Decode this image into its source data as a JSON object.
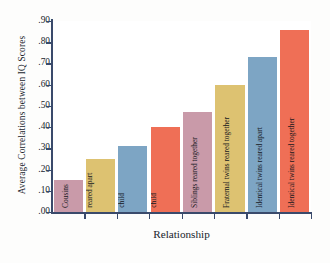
{
  "chart_data": {
    "type": "bar",
    "title": "",
    "xlabel": "Relationship",
    "ylabel": "Average Correlations between IQ Scores",
    "ylim": [
      0.0,
      0.9
    ],
    "grid": false,
    "legend": "none",
    "ytick_labels": [
      ".90",
      ".80",
      ".70",
      ".60",
      ".50",
      ".40",
      ".30",
      ".20",
      ".10",
      ".00"
    ],
    "ytick_values": [
      0.9,
      0.8,
      0.7,
      0.6,
      0.5,
      0.4,
      0.3,
      0.2,
      0.1,
      0.0
    ],
    "categories": [
      "Cousins",
      "Siblings reared apart",
      "Foster parent/ child",
      "Biological parent/ child",
      "Siblings reared together",
      "Fraternal twins reared together",
      "Identical twins reared apart",
      "Identical twins reared together"
    ],
    "values": [
      0.15,
      0.25,
      0.31,
      0.4,
      0.47,
      0.6,
      0.73,
      0.86
    ],
    "bar_colors": [
      "#c99aa9",
      "#ddc271",
      "#7da5c4",
      "#ef6f56",
      "#c99aa9",
      "#ddc271",
      "#7da5c4",
      "#ef6f56"
    ],
    "bars": [
      {
        "label_line1": "Cousins",
        "label_line2": "",
        "value": 0.15,
        "color": "#c99aa9"
      },
      {
        "label_line1": "Siblings",
        "label_line2": "reared apart",
        "value": 0.25,
        "color": "#ddc271"
      },
      {
        "label_line1": "Foster parent/",
        "label_line2": "child",
        "value": 0.31,
        "color": "#7da5c4"
      },
      {
        "label_line1": "Biological parent/",
        "label_line2": "child",
        "value": 0.4,
        "color": "#ef6f56"
      },
      {
        "label_line1": "Siblings reared together",
        "label_line2": "",
        "value": 0.47,
        "color": "#c99aa9"
      },
      {
        "label_line1": "Fraternal twins reared together",
        "label_line2": "",
        "value": 0.6,
        "color": "#ddc271"
      },
      {
        "label_line1": "Identical twins reared apart",
        "label_line2": "",
        "value": 0.73,
        "color": "#7da5c4"
      },
      {
        "label_line1": "Identical twins reared together",
        "label_line2": "",
        "value": 0.86,
        "color": "#ef6f56"
      }
    ]
  },
  "colors": {
    "axis": "#3a4a6b",
    "pink": "#c99aa9",
    "tan": "#ddc271",
    "blue": "#7da5c4",
    "red": "#ef6f56",
    "background": "#fdfdfc",
    "plot_background": "#ffffff"
  }
}
